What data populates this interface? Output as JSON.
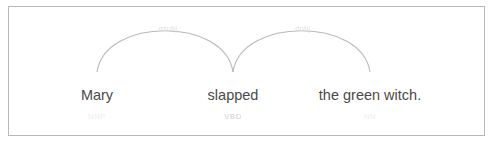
{
  "visualization": {
    "type": "dependency-parse",
    "sentence": "Mary slapped the green witch.",
    "background_color": "#ffffff",
    "border_color": "#b8b8b8",
    "word_color": "#4a4a4a",
    "tag_color": "#cfcfcf",
    "arc_color": "#b9b9b9",
    "arc_label_color": "#dedede"
  },
  "words": [
    {
      "text": "Mary",
      "tag": "NNP",
      "x": 97,
      "tag_shade": "faint"
    },
    {
      "text": "slapped",
      "tag": "VBD",
      "x": 233,
      "tag_shade": "mid"
    },
    {
      "text": "the green witch.",
      "tag": "NN",
      "x": 370,
      "tag_shade": "faint"
    }
  ],
  "arcs": [
    {
      "label": "nsubj",
      "start_word": "Mary",
      "end_word": "slapped",
      "direction": "right",
      "x1": 97,
      "x2": 233,
      "label_x": 168,
      "label_y": 31
    },
    {
      "label": "dobj",
      "start_word": "slapped",
      "end_word": "the green witch.",
      "direction": "right",
      "x1": 233,
      "x2": 370,
      "label_x": 303,
      "label_y": 31
    }
  ],
  "geometry": {
    "baseline_y": 72,
    "arc_apex_y": 21,
    "word_baseline_y": 100,
    "tag_baseline_y": 119
  }
}
